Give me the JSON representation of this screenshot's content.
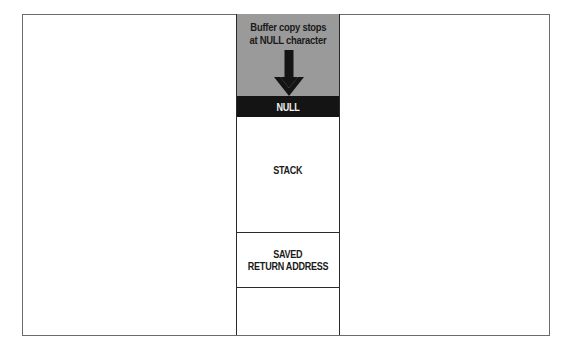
{
  "diagram": {
    "title": "Buffer copy stops at NULL character",
    "annotation": {
      "line1": "Buffer copy stops",
      "line2": "at NULL character",
      "icon": "arrow-down-icon"
    },
    "memory_cells": [
      {
        "label": "NULL",
        "fill": "#141414",
        "text_color": "#f2f2f2"
      },
      {
        "label": "STACK",
        "fill": "#ffffff",
        "text_color": "#1a1a1a"
      },
      {
        "label_line1": "SAVED",
        "label_line2": "RETURN ADDRESS",
        "fill": "#ffffff",
        "text_color": "#1a1a1a"
      },
      {
        "label": "",
        "fill": "#ffffff"
      }
    ],
    "colors": {
      "buffer_region": "#9a9a9a",
      "null_band": "#141414",
      "frame": "#6b6b6b"
    }
  }
}
